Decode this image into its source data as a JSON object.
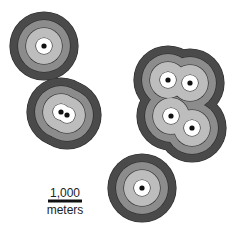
{
  "map": {
    "type": "multiple-ring buffer map",
    "colors": {
      "background": "#ffffff",
      "ring_outer": "#4a4a4a",
      "ring_mid": "#8c8c8c",
      "ring_inner": "#bdbdbd",
      "core": "#ffffff",
      "ring_stroke": "#2a2a2a",
      "point": "#111111"
    },
    "ring_radii_px": {
      "outer": 34,
      "mid": 26,
      "inner": 18,
      "core": 8
    },
    "point_radius_px": 2.6,
    "buffers": [
      {
        "id": "buffer-top-left",
        "points": [
          [
            44,
            46
          ]
        ]
      },
      {
        "id": "buffer-middle-left",
        "points": [
          [
            61,
            112
          ],
          [
            67,
            115
          ]
        ]
      },
      {
        "id": "buffer-right-cluster",
        "points": [
          [
            168,
            80
          ],
          [
            190,
            83
          ],
          [
            171,
            116
          ],
          [
            192,
            128
          ]
        ]
      },
      {
        "id": "buffer-bottom",
        "points": [
          [
            142,
            188
          ]
        ]
      }
    ]
  },
  "scale_bar": {
    "value_label": "1,000",
    "unit_label": "meters"
  }
}
